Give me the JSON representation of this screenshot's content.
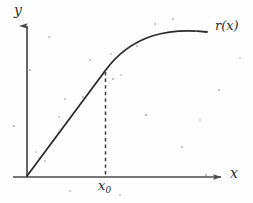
{
  "figure": {
    "background_color": "#fefefe",
    "ink_color": "#3a3a3a",
    "curve_color": "#2b2b2b",
    "axis_color": "#4a4a4a"
  },
  "labels": {
    "y_axis": "y",
    "x_axis": "x",
    "x_zero": "x",
    "x_zero_subscript": "0",
    "curve": "r(x)"
  },
  "chart_data": {
    "type": "line",
    "title": "",
    "xlabel": "x",
    "ylabel": "y",
    "series": [
      {
        "name": "r(x)",
        "description": "Increasing concave function: linear from origin up to x0, then curving to a horizontal asymptote",
        "points": [
          {
            "x": 0,
            "y": 0
          },
          {
            "x": 10,
            "y": 12
          },
          {
            "x": 20,
            "y": 24
          },
          {
            "x": 30,
            "y": 36
          },
          {
            "x": 40,
            "y": 48
          },
          {
            "x": 44,
            "y": 53
          },
          {
            "x": 50,
            "y": 60
          },
          {
            "x": 56,
            "y": 66
          },
          {
            "x": 62,
            "y": 72
          },
          {
            "x": 70,
            "y": 79
          },
          {
            "x": 78,
            "y": 85
          },
          {
            "x": 86,
            "y": 89
          },
          {
            "x": 94,
            "y": 92
          },
          {
            "x": 100,
            "y": 94
          }
        ]
      }
    ],
    "annotations": [
      {
        "type": "vertical-dashed-line",
        "label": "x0",
        "x": 44,
        "y_from": 0,
        "y_to": 53,
        "note": "dashed drop line from the curve down to the x-axis at x0"
      },
      {
        "type": "text",
        "label": "r(x)",
        "position": "end-of-curve-right"
      }
    ],
    "xlim": [
      0,
      112
    ],
    "ylim": [
      0,
      105
    ],
    "grid": false,
    "legend": false
  },
  "geometry": {
    "y_axis_x_px": 27,
    "x_axis_y_px": 177,
    "x_zero_px": 105,
    "curve_start_px": [
      27,
      176
    ],
    "curve_end_px": [
      207,
      32
    ],
    "kink_px": [
      105,
      71
    ]
  },
  "specks": [
    {
      "x": 36,
      "y": 152,
      "r": 1.0
    },
    {
      "x": 45,
      "y": 161,
      "r": 1.1
    },
    {
      "x": 65,
      "y": 99,
      "r": 1.0
    },
    {
      "x": 83,
      "y": 97,
      "r": 0.9
    },
    {
      "x": 113,
      "y": 79,
      "r": 1.0
    },
    {
      "x": 121,
      "y": 75,
      "r": 0.9
    },
    {
      "x": 111,
      "y": 54,
      "r": 0.8
    },
    {
      "x": 137,
      "y": 46,
      "r": 0.9
    },
    {
      "x": 155,
      "y": 24,
      "r": 1.0
    },
    {
      "x": 173,
      "y": 19,
      "r": 1.0
    },
    {
      "x": 196,
      "y": 31,
      "r": 0.8
    },
    {
      "x": 59,
      "y": 117,
      "r": 0.8
    },
    {
      "x": 90,
      "y": 60,
      "r": 0.8
    },
    {
      "x": 30,
      "y": 70,
      "r": 0.7
    },
    {
      "x": 146,
      "y": 115,
      "r": 0.7
    },
    {
      "x": 200,
      "y": 120,
      "r": 0.7
    },
    {
      "x": 70,
      "y": 191,
      "r": 0.7
    },
    {
      "x": 182,
      "y": 147,
      "r": 0.7
    },
    {
      "x": 219,
      "y": 90,
      "r": 0.7
    },
    {
      "x": 14,
      "y": 126,
      "r": 0.7
    },
    {
      "x": 240,
      "y": 58,
      "r": 0.7
    },
    {
      "x": 120,
      "y": 195,
      "r": 0.7
    },
    {
      "x": 49,
      "y": 37,
      "r": 0.7
    },
    {
      "x": 206,
      "y": 175,
      "r": 0.7
    }
  ]
}
